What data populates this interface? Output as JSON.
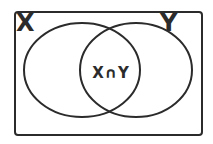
{
  "diagram": {
    "type": "venn",
    "sets": [
      {
        "label": "X"
      },
      {
        "label": "Y"
      }
    ],
    "intersection_label": "X∩Y",
    "colors": {
      "stroke": "#2b2b2b",
      "background": "#ffffff"
    }
  }
}
